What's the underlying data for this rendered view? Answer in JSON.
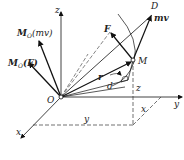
{
  "diagram": {
    "axes": {
      "x": "x",
      "y": "y",
      "z": "z"
    },
    "origin": "O",
    "points": {
      "particle": "M",
      "tip": "D"
    },
    "vectors": {
      "force": "F",
      "momentum": "mv",
      "position": "r",
      "moment_of_momentum": {
        "main": "M",
        "sub": "O",
        "arg": "(mv)"
      },
      "moment_of_force": {
        "main": "M",
        "sub": "O",
        "arg": "(F)"
      }
    },
    "dimensions": {
      "distance": "d",
      "x": "x",
      "y": "y",
      "z": "z"
    }
  }
}
